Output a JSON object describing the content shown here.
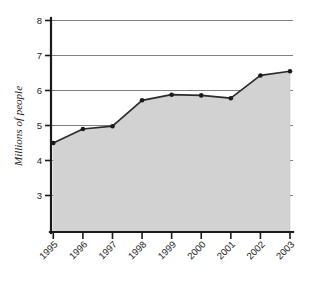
{
  "chart_data": {
    "type": "area",
    "title": "",
    "subtitle": "",
    "xlabel": "",
    "ylabel": "Millions of people",
    "categories": [
      "1995",
      "1996",
      "1997",
      "1998",
      "1999",
      "2000",
      "2001",
      "2002",
      "2003"
    ],
    "values": [
      4.5,
      4.9,
      4.98,
      5.72,
      5.88,
      5.86,
      5.78,
      6.43,
      6.55
    ],
    "series": [
      {
        "name": "Millions of people",
        "values": [
          4.5,
          4.9,
          4.98,
          5.72,
          5.88,
          5.86,
          5.78,
          6.43,
          6.55
        ]
      }
    ],
    "ylim": [
      2.4,
      8
    ],
    "yticks": [
      3,
      4,
      5,
      6,
      7,
      8
    ],
    "ytick_labels": [
      "3",
      "4",
      "5",
      "6",
      "7",
      "8"
    ],
    "xtick_labels": [
      "1995",
      "1996",
      "1997",
      "1998",
      "1999",
      "2000",
      "2001",
      "2002",
      "2003"
    ],
    "xtick_rotation": -45,
    "grid": "horizontal",
    "legend": "none",
    "markers": true,
    "colors": {
      "area_fill": "#d2d2d2",
      "line": "#2b2b2b",
      "marker": "#1a1a1a",
      "grid": "#808080",
      "axis": "#1a1a1a",
      "background": "#ffffff"
    }
  },
  "axes": {
    "y_title": "Millions of people"
  }
}
